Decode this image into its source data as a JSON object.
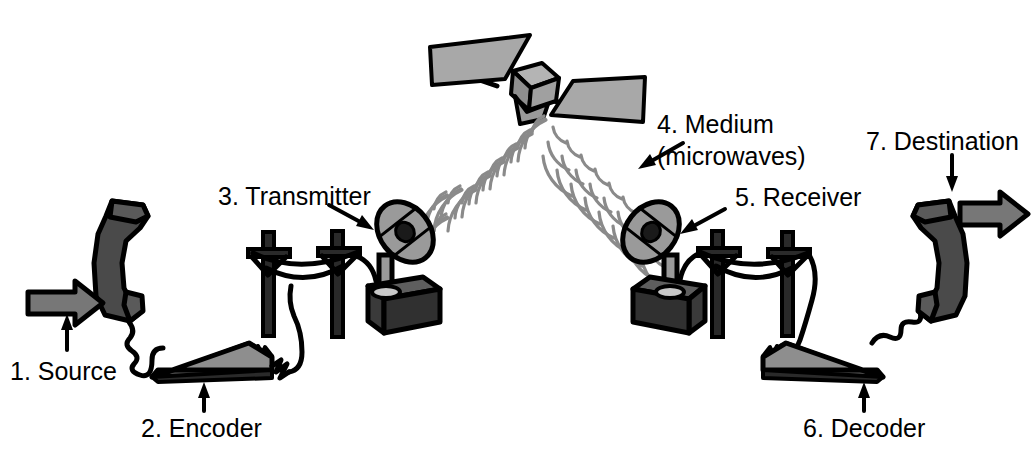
{
  "diagram": {
    "background_color": "#ffffff",
    "width": 1034,
    "height": 462,
    "palette": {
      "outline": "#000000",
      "light_gray": "#a8a8a8",
      "mid_gray": "#8a8a8a",
      "dark_gray": "#4a4a4a",
      "darker_gray": "#3a3a3a",
      "text": "#000000"
    }
  },
  "labels": {
    "source": "1. Source",
    "encoder": "2. Encoder",
    "transmitter": "3. Transmitter",
    "medium_line1": "4. Medium",
    "medium_line2": "(microwaves)",
    "receiver": "5. Receiver",
    "decoder": "6. Decoder",
    "destination": "7. Destination"
  },
  "steps": [
    {
      "number": "1",
      "name": "Source",
      "label": "1. Source",
      "side": "left",
      "pointer": "up"
    },
    {
      "number": "2",
      "name": "Encoder",
      "label": "2. Encoder",
      "side": "left",
      "pointer": "up"
    },
    {
      "number": "3",
      "name": "Transmitter",
      "label": "3. Transmitter",
      "side": "left",
      "pointer": "down-right"
    },
    {
      "number": "4",
      "name": "Medium",
      "label": "4. Medium (microwaves)",
      "side": "center",
      "pointer": "down-left"
    },
    {
      "number": "5",
      "name": "Receiver",
      "label": "5. Receiver",
      "side": "right",
      "pointer": "down-left"
    },
    {
      "number": "6",
      "name": "Decoder",
      "label": "6. Decoder",
      "side": "right",
      "pointer": "up"
    },
    {
      "number": "7",
      "name": "Destination",
      "label": "7. Destination",
      "side": "right",
      "pointer": "down"
    }
  ],
  "objects": {
    "satellite": {
      "name": "satellite",
      "panels": 2,
      "body": "cube"
    },
    "phone_left": {
      "name": "telephone-handset-left"
    },
    "phone_right": {
      "name": "telephone-handset-right"
    },
    "encoder_device": {
      "name": "encoder-modem"
    },
    "decoder_device": {
      "name": "decoder-modem"
    },
    "dish_left": {
      "name": "transmitter-dish"
    },
    "dish_right": {
      "name": "receiver-dish"
    },
    "poles_left": {
      "name": "utility-poles-left",
      "count": 2
    },
    "poles_right": {
      "name": "utility-poles-right",
      "count": 2
    },
    "beam_up": {
      "name": "uplink-microwave-beam"
    },
    "beam_down": {
      "name": "downlink-microwave-beam"
    },
    "arrow_in": {
      "name": "source-input-arrow",
      "direction": "right"
    },
    "arrow_out": {
      "name": "destination-output-arrow",
      "direction": "right"
    }
  }
}
